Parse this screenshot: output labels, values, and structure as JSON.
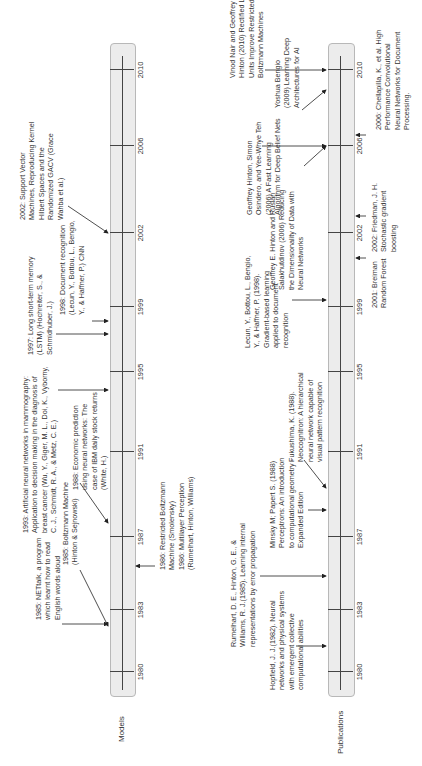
{
  "diagram": {
    "type": "timeline",
    "orientation": "rotated-90-ccw",
    "years": [
      "1980",
      "1983",
      "1987",
      "1991",
      "1995",
      "1999",
      "2002",
      "2006",
      "2010"
    ],
    "rows": [
      {
        "label": "Models"
      },
      {
        "label": "Publications"
      }
    ]
  },
  "models_events": [
    {
      "id": "m1985a",
      "year": 1985,
      "text": "1985: NETtalk, a program\nwhich learnt how to read\nEnglish words aloud"
    },
    {
      "id": "m1985b",
      "year": 1985,
      "text": "1985: Boltzmann Machine\n(Hinton & Sejnowski)"
    },
    {
      "id": "m1986",
      "year": 1986,
      "text": "1986: Restricted Boltzmann\nMachine (Smolensky)\n1986: Multilayer Perception\n(Rumelhart, Hinton, Williams)"
    },
    {
      "id": "m1988",
      "year": 1988,
      "text": "1988: Economic prediction\nusing neural networks: The\ncase of IBM daily stock returns\n(White, H.)"
    },
    {
      "id": "m1993",
      "year": 1993,
      "text": "1993: Artificial neural networks in mammography:\nApplication to decision making in the diagnosis of\nbreast cancer (Wu, Y., Giger, M. L., Doi, K., Vyborny,\nC. J., Schmidt, R. A., & Metz, C. E.)"
    },
    {
      "id": "m1997",
      "year": 1997,
      "text": "1997: Long short-term memory\n(LSTM) (Hochreiter, S., &\nSchmidhuber, J.)"
    },
    {
      "id": "m1998",
      "year": 1998,
      "text": "1998: Document recognition\n(Lecun, Y., Bottou, L., Bengio,\nY., & Haffner, P.) CNN"
    },
    {
      "id": "m2002",
      "year": 2002,
      "text": "2002: Support Vector\nMachines, Reproducing Kernel\nHilbert Spaces and the\nRandomized GACV (Grace\nWahba et al.)"
    }
  ],
  "publication_events": [
    {
      "id": "p1982",
      "year": 1982,
      "text": "Hopfield, J. J.(1982). Neural\nnetworks and physical systems\nwith emergent collective\ncomputational abilities"
    },
    {
      "id": "p1985",
      "year": 1985,
      "text": "Rumelhart, D. E., Hinton, G. E., &\nWilliams, R. J.(1985). Learning internal\nrepresentations by error propagation"
    },
    {
      "id": "p1988a",
      "year": 1988,
      "text": "Minsky M; Papert S. (1988)\nPerceptrons: An introduction\nto computational geometry -\nExpanded Edition"
    },
    {
      "id": "p1988b",
      "year": 1988,
      "text": "Fukushima, K. (1988).\nNeocognitron: A hierarchical\nneural network capable of\nvisual pattern recognition"
    },
    {
      "id": "p1998",
      "year": 1998,
      "text": "Lecun, Y., Bottou, L., Bengio,\nY., & Haffner, P. (1998).\nGradient-based learning\napplied to document\nrecognition"
    },
    {
      "id": "p2001",
      "year": 2001,
      "text": "2001: Breiman\nRandom Forest"
    },
    {
      "id": "p2002",
      "year": 2002,
      "text": "2002: Friedman, J. H.\nStochastic gradient\nboosting"
    },
    {
      "id": "p2006a",
      "year": 2006,
      "text": "Geoffrey E. Hinton and Ruslan\nSalakhutdinov (2006) Reducing\nthe Dimensionality of Data with\nNeural Networks"
    },
    {
      "id": "p2006b",
      "year": 2006,
      "text": "Geoffrey Hinton, Simon\nOsindero, and Yee-Whye Teh\n(2006) A Fast Learning\nAlgorithm for Deep Belief Nets"
    },
    {
      "id": "p2006c",
      "year": 2006,
      "text": "2006: Chellapilla, K., et al. High\nPerformance Convolutional\nNeural Networks for Document\nProcessing."
    },
    {
      "id": "p2009",
      "year": 2009,
      "text": "Yoshua Bengio\n(2009) Learning Deep\nArchitectures for AI"
    },
    {
      "id": "p2010",
      "year": 2010,
      "text": "Vinod Nair and Geoffrey E.\nHinton (2010) Rectified Linear\nUnits Improve Restricted\nBoltzmann Machines"
    }
  ]
}
